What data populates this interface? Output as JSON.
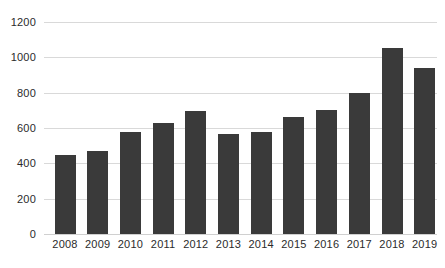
{
  "chart_data": {
    "type": "bar",
    "title": "",
    "xlabel": "",
    "ylabel": "",
    "categories": [
      "2008",
      "2009",
      "2010",
      "2011",
      "2012",
      "2013",
      "2014",
      "2015",
      "2016",
      "2017",
      "2018",
      "2019"
    ],
    "values": [
      448,
      470,
      578,
      629,
      697,
      566,
      578,
      663,
      702,
      799,
      1053,
      940
    ],
    "series": [
      {
        "name": "",
        "values": [
          448,
          470,
          578,
          629,
          697,
          566,
          578,
          663,
          702,
          799,
          1053,
          940
        ]
      }
    ],
    "ylim": [
      0,
      1200
    ],
    "yticks": [
      0,
      200,
      400,
      600,
      800,
      1000,
      1200
    ],
    "ytick_labels": [
      "0",
      "200",
      "400",
      "600",
      "800",
      "1000",
      "1200"
    ],
    "grid": true,
    "legend": false,
    "legend_position": "none",
    "bar_color": "#3a3a3a",
    "gridline_color": "#d9d9d9",
    "background_color": "#ffffff",
    "axis_text_color": "#2b2b2b"
  }
}
